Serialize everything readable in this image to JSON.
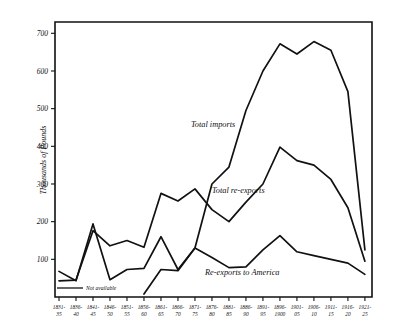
{
  "chart_data": {
    "type": "line",
    "title": "",
    "xlabel": "",
    "ylabel": "Thousands of Pounds",
    "ylim": [
      0,
      730
    ],
    "yticks": [
      100,
      200,
      300,
      400,
      500,
      600,
      700
    ],
    "ytick_labels": [
      "100",
      "200",
      "300",
      "400",
      "500",
      "600",
      "700"
    ],
    "grid": false,
    "legend_position": "inline-annotations",
    "categories": [
      "1831-35",
      "1836-40",
      "1841-45",
      "1846-50",
      "1851-55",
      "1856-60",
      "1861-65",
      "1866-70",
      "1871-75",
      "1876-80",
      "1881-85",
      "1886-90",
      "1891-95",
      "1896-1900",
      "1901-05",
      "1906-10",
      "1911-15",
      "1916-20",
      "1921-25"
    ],
    "series": [
      {
        "name": "Total imports",
        "label": "Total imports",
        "values": [
          68,
          43,
          194,
          46,
          73,
          76,
          160,
          73,
          130,
          300,
          345,
          495,
          600,
          672,
          645,
          678,
          655,
          545,
          125
        ]
      },
      {
        "name": "Total re-exports",
        "label": "Total re-exports",
        "values": [
          43,
          45,
          176,
          136,
          150,
          132,
          275,
          255,
          287,
          232,
          200,
          252,
          300,
          398,
          362,
          350,
          312,
          237,
          95
        ]
      },
      {
        "name": "Re-exports to America",
        "label": "Re-exports to America",
        "values": [
          null,
          null,
          null,
          null,
          null,
          8,
          73,
          70,
          130,
          105,
          78,
          80,
          125,
          163,
          120,
          110,
          100,
          90,
          60
        ]
      }
    ],
    "annotations": [
      {
        "text": "Not available",
        "note": "early years of Re-exports to America series"
      }
    ]
  }
}
